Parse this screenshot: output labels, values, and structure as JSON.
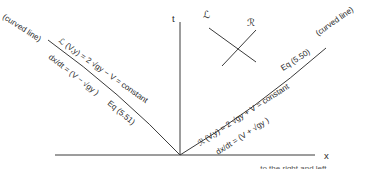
{
  "axes": {
    "t_label": "t",
    "x_label": "x"
  },
  "left_characteristic": {
    "curved_note": "(curved line)",
    "invariant": "ℒ (V,y) = 2 √gy − V = constant",
    "slope": "dx/dt = (V − √gy )",
    "equation_ref": "Eq (5.51)"
  },
  "right_characteristic": {
    "curved_note": "(curved line)",
    "invariant": "ℛ (V,y) = 2 √gy + V = constant",
    "slope": "dx/dt = (V + √gy )",
    "equation_ref": "Eq (5.50)"
  },
  "inset": {
    "left_label": "ℒ",
    "right_label": "ℛ"
  },
  "caption_partial": "… to the right and left",
  "colors": {
    "line": "#3a3a3a",
    "text": "#2a2a2a",
    "background": "#ffffff"
  }
}
